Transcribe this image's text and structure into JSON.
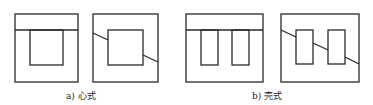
{
  "figures": [
    {
      "id": "a",
      "caption": "a) 心式",
      "description": "core-type transformer core"
    },
    {
      "id": "b",
      "caption": "b) 壳式",
      "description": "shell-type transformer core"
    }
  ],
  "colors": {
    "stroke": "#2a2a2a",
    "background": "#ffffff"
  }
}
